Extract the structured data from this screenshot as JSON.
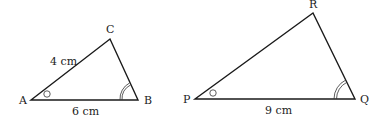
{
  "diagram": {
    "triangles": [
      {
        "name": "ABC",
        "vertices": [
          {
            "label": "A",
            "x": 31,
            "y": 100,
            "lx": 19,
            "ly": 104
          },
          {
            "label": "B",
            "x": 138,
            "y": 100,
            "lx": 144,
            "ly": 104
          },
          {
            "label": "C",
            "x": 110,
            "y": 39,
            "lx": 106,
            "ly": 33
          }
        ],
        "sides": [
          {
            "from": "A",
            "to": "C",
            "label": "4 cm",
            "lx": 50,
            "ly": 65
          },
          {
            "from": "A",
            "to": "B",
            "label": "6 cm",
            "lx": 72,
            "ly": 115
          }
        ],
        "angle_marks": [
          {
            "vertex": "A",
            "type": "single-circle"
          },
          {
            "vertex": "B",
            "type": "double-arc"
          }
        ]
      },
      {
        "name": "PQR",
        "vertices": [
          {
            "label": "P",
            "x": 195,
            "y": 99,
            "lx": 183,
            "ly": 103
          },
          {
            "label": "Q",
            "x": 355,
            "y": 99,
            "lx": 360,
            "ly": 103
          },
          {
            "label": "R",
            "x": 313,
            "y": 13,
            "lx": 309,
            "ly": 8
          }
        ],
        "sides": [
          {
            "from": "P",
            "to": "Q",
            "label": "9 cm",
            "lx": 265,
            "ly": 114
          }
        ],
        "angle_marks": [
          {
            "vertex": "P",
            "type": "single-circle"
          },
          {
            "vertex": "Q",
            "type": "double-arc"
          }
        ]
      }
    ]
  }
}
